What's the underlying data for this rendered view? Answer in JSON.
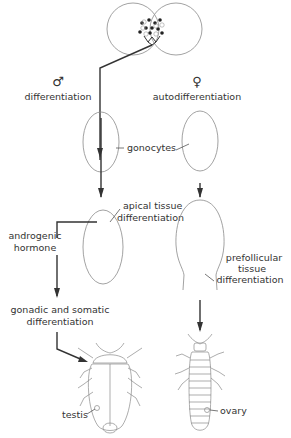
{
  "diagram": {
    "topic": "Sex differentiation of gonads",
    "male": {
      "symbol": "♂",
      "stage1_label": "differentiation",
      "apical_label_line1": "apical tissue",
      "apical_label_line2": "differentiation",
      "hormone_label_line1": "androgenic",
      "hormone_label_line2": "hormone",
      "somatic_label_line1": "gonadic and somatic",
      "somatic_label_line2": "differentiation",
      "organ_label": "testis"
    },
    "female": {
      "symbol": "♀",
      "stage1_label": "autodifferentiation",
      "prefollicular_line1": "prefollicular",
      "prefollicular_line2": "tissue",
      "prefollicular_line3": "differentiation",
      "organ_label": "ovary"
    },
    "shared": {
      "gonocytes_label": "gonocytes"
    }
  }
}
